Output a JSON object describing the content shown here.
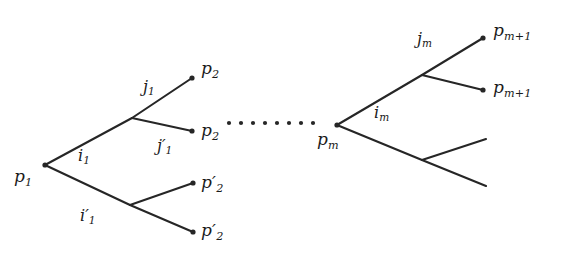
{
  "figure": {
    "type": "tree-diagram",
    "background_color": "#ffffff",
    "stroke_color": "#262626",
    "width": 579,
    "height": 260
  },
  "nodes": [
    {
      "id": "root",
      "label_html": "p<sub>1</sub>",
      "label_text": "p_1",
      "x": 45,
      "y": 165,
      "label_x": 14,
      "label_y": 168,
      "dot": true
    },
    {
      "id": "n_up",
      "label_html": "",
      "label_text": "",
      "x": 132,
      "y": 118,
      "label_x": 0,
      "label_y": 0,
      "dot": false
    },
    {
      "id": "n_dn",
      "label_html": "",
      "label_text": "",
      "x": 130,
      "y": 205,
      "label_x": 0,
      "label_y": 0,
      "dot": false
    },
    {
      "id": "p2_a",
      "label_html": "p<sub>2</sub>",
      "label_text": "p_2",
      "x": 192,
      "y": 78,
      "label_x": 201,
      "label_y": 60,
      "dot": true
    },
    {
      "id": "p2_b",
      "label_html": "p<sub>2</sub>",
      "label_text": "p_2",
      "x": 192,
      "y": 131,
      "label_x": 201,
      "label_y": 122,
      "dot": true
    },
    {
      "id": "p2p_a",
      "label_html": "p<span class=\"prime\">&prime;</span><sub>2</sub>",
      "label_text": "p'_2",
      "x": 193,
      "y": 183,
      "label_x": 201,
      "label_y": 174,
      "dot": true
    },
    {
      "id": "p2p_b",
      "label_html": "p<span class=\"prime\">&prime;</span><sub>2</sub>",
      "label_text": "p'_2",
      "x": 193,
      "y": 232,
      "label_x": 201,
      "label_y": 222,
      "dot": true
    },
    {
      "id": "pm",
      "label_html": "p<sub>m</sub>",
      "label_text": "p_m",
      "x": 337,
      "y": 125,
      "label_x": 317,
      "label_y": 131,
      "dot": true
    },
    {
      "id": "m_up",
      "label_html": "",
      "label_text": "",
      "x": 422,
      "y": 75,
      "label_x": 0,
      "label_y": 0,
      "dot": false
    },
    {
      "id": "m_dn",
      "label_html": "",
      "label_text": "",
      "x": 422,
      "y": 160,
      "label_x": 0,
      "label_y": 0,
      "dot": false
    },
    {
      "id": "pm1_a",
      "label_html": "p<sub>m+1</sub>",
      "label_text": "p_{m+1}",
      "x": 483,
      "y": 38,
      "label_x": 493,
      "label_y": 22,
      "dot": true
    },
    {
      "id": "pm1_b",
      "label_html": "p<sub>m+1</sub>",
      "label_text": "p_{m+1}",
      "x": 483,
      "y": 90,
      "label_x": 493,
      "label_y": 79,
      "dot": true
    },
    {
      "id": "leaf_a",
      "label_html": "",
      "label_text": "",
      "x": 486,
      "y": 139,
      "label_x": 0,
      "label_y": 0,
      "dot": false
    },
    {
      "id": "leaf_b",
      "label_html": "",
      "label_text": "",
      "x": 486,
      "y": 186,
      "label_x": 0,
      "label_y": 0,
      "dot": false
    }
  ],
  "edges": [
    {
      "from": "root",
      "to": "n_up",
      "label_html": "i<sub>1</sub>",
      "label_text": "i_1",
      "label_x": 78,
      "label_y": 148
    },
    {
      "from": "root",
      "to": "n_dn",
      "label_html": "i<span class=\"prime\">&prime;</span><sub>1</sub>",
      "label_text": "i'_1",
      "label_x": 80,
      "label_y": 208
    },
    {
      "from": "n_up",
      "to": "p2_a",
      "label_html": "j<sub>1</sub>",
      "label_text": "j_1",
      "label_x": 143,
      "label_y": 79
    },
    {
      "from": "n_up",
      "to": "p2_b",
      "label_html": "j<span class=\"prime\">&prime;</span><sub>1</sub>",
      "label_text": "j'_1",
      "label_x": 157,
      "label_y": 138
    },
    {
      "from": "n_dn",
      "to": "p2p_a",
      "label_html": "",
      "label_text": "",
      "label_x": 0,
      "label_y": 0
    },
    {
      "from": "n_dn",
      "to": "p2p_b",
      "label_html": "",
      "label_text": "",
      "label_x": 0,
      "label_y": 0
    },
    {
      "from": "pm",
      "to": "m_up",
      "label_html": "i<sub>m</sub>",
      "label_text": "i_m",
      "label_x": 374,
      "label_y": 105
    },
    {
      "from": "pm",
      "to": "m_dn",
      "label_html": "",
      "label_text": "",
      "label_x": 0,
      "label_y": 0
    },
    {
      "from": "m_up",
      "to": "pm1_a",
      "label_html": "j<sub>m</sub>",
      "label_text": "j_m",
      "label_x": 417,
      "label_y": 31
    },
    {
      "from": "m_up",
      "to": "pm1_b",
      "label_html": "",
      "label_text": "",
      "label_x": 0,
      "label_y": 0
    },
    {
      "from": "m_dn",
      "to": "leaf_a",
      "label_html": "",
      "label_text": "",
      "label_x": 0,
      "label_y": 0
    },
    {
      "from": "m_dn",
      "to": "leaf_b",
      "label_html": "",
      "label_text": "",
      "label_x": 0,
      "label_y": 0
    }
  ],
  "ellipsis": {
    "name": "horizontal-ellipsis",
    "count": 8,
    "start_x": 229,
    "end_x": 313,
    "y": 123,
    "radius": 2.1
  }
}
